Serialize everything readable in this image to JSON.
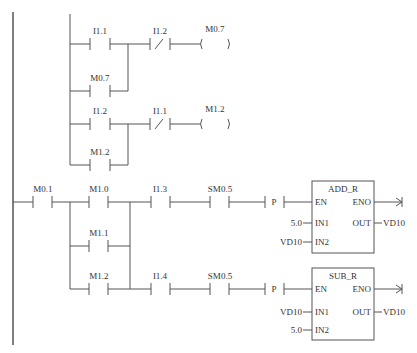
{
  "network1": {
    "contact_a": "I1.1",
    "contact_b_nc": "I1.2",
    "coil": "M0.7",
    "branch_contact": "M0.7"
  },
  "network2": {
    "contact_a": "I1.2",
    "contact_b_nc": "I1.1",
    "coil": "M1.2",
    "branch_contact": "M1.2"
  },
  "network3": {
    "m01": "M0.1",
    "m10": "M1.0",
    "m11": "M1.1",
    "m12": "M1.2",
    "i13": "I1.3",
    "sm05_top": "SM0.5",
    "i14": "I1.4",
    "sm05_bottom": "SM0.5",
    "p_top": "P",
    "p_bottom": "P",
    "add_block": {
      "title": "ADD_R",
      "en": "EN",
      "eno": "ENO",
      "in1": "IN1",
      "in2": "IN2",
      "out": "OUT",
      "in1_value": "5.0",
      "in2_value": "VD10",
      "out_value": "VD10"
    },
    "sub_block": {
      "title": "SUB_R",
      "en": "EN",
      "eno": "ENO",
      "in1": "IN1",
      "in2": "IN2",
      "out": "OUT",
      "in1_value": "VD10",
      "in2_value": "5.0",
      "out_value": "VD10"
    }
  }
}
